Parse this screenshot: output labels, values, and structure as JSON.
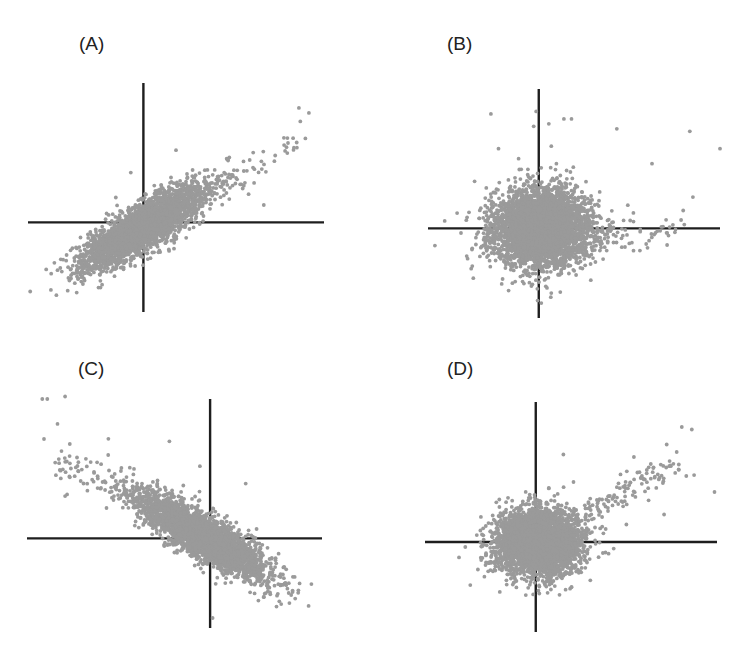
{
  "chart_data": [
    {
      "id": "A",
      "type": "scatter",
      "title": "(A)",
      "xlabel": "",
      "ylabel": "",
      "xlim": [
        -2.3,
        3.6
      ],
      "ylim": [
        -1.8,
        2.8
      ],
      "axes_cross_at": [
        0,
        0
      ],
      "grid": false,
      "legend": "none",
      "description": "Strong positive linear correlation; dense elongated cloud centered slightly below-left of origin with a sparse tail toward upper right",
      "cloud": {
        "n": 3200,
        "cx": 0.0,
        "cy": -0.1,
        "sx": 0.7,
        "sy": 0.2,
        "angle_deg": 32
      },
      "tail": {
        "n": 60,
        "from": [
          1.3,
          0.6
        ],
        "to": [
          3.1,
          1.6
        ],
        "spread": 0.28
      },
      "outliers": [
        [
          3.1,
          2.3
        ],
        [
          3.3,
          2.2
        ],
        [
          0.65,
          1.45
        ],
        [
          -0.25,
          1.0
        ],
        [
          -0.55,
          0.5
        ],
        [
          2.8,
          1.7
        ],
        [
          3.0,
          1.5
        ],
        [
          2.4,
          0.35
        ],
        [
          1.0,
          -0.1
        ],
        [
          -1.6,
          -0.75
        ],
        [
          -1.5,
          -0.9
        ],
        [
          -1.3,
          -1.0
        ],
        [
          0.3,
          -0.6
        ]
      ]
    },
    {
      "id": "B",
      "type": "scatter",
      "title": "(B)",
      "xlabel": "",
      "ylabel": "",
      "xlim": [
        -2.2,
        3.6
      ],
      "ylim": [
        -1.8,
        2.8
      ],
      "axes_cross_at": [
        0,
        0
      ],
      "grid": false,
      "legend": "none",
      "description": "No correlation; roughly circular dense cloud centered at origin with scattered points extending upward and to the right",
      "cloud": {
        "n": 4200,
        "cx": 0.05,
        "cy": 0.0,
        "sx": 0.48,
        "sy": 0.38,
        "angle_deg": 0
      },
      "tail": {
        "n": 70,
        "from": [
          0.9,
          -0.2
        ],
        "to": [
          2.9,
          0.1
        ],
        "spread": 0.35
      },
      "outliers": [
        [
          -0.95,
          2.3
        ],
        [
          -0.1,
          2.05
        ],
        [
          0.2,
          2.1
        ],
        [
          0.5,
          2.2
        ],
        [
          0.65,
          2.2
        ],
        [
          1.55,
          2.0
        ],
        [
          3.0,
          1.95
        ],
        [
          3.6,
          1.6
        ],
        [
          2.25,
          1.3
        ],
        [
          -1.3,
          -1.0
        ],
        [
          -1.1,
          -0.5
        ],
        [
          -0.6,
          -1.25
        ],
        [
          0.25,
          -1.3
        ],
        [
          0.05,
          -1.5
        ],
        [
          -0.05,
          2.35
        ],
        [
          0.25,
          1.65
        ],
        [
          0.35,
          1.3
        ],
        [
          -0.4,
          1.4
        ],
        [
          -0.8,
          1.6
        ]
      ]
    },
    {
      "id": "C",
      "type": "scatter",
      "title": "(C)",
      "xlabel": "",
      "ylabel": "",
      "xlim": [
        -3.6,
        2.2
      ],
      "ylim": [
        -1.8,
        2.8
      ],
      "axes_cross_at": [
        0,
        0
      ],
      "grid": false,
      "legend": "none",
      "description": "Strong negative linear correlation; dense elongated cloud centered slightly below-right of origin with sparse tail toward upper left",
      "cloud": {
        "n": 3200,
        "cx": -0.15,
        "cy": 0.05,
        "sx": 0.75,
        "sy": 0.2,
        "angle_deg": -33
      },
      "tail": {
        "n": 70,
        "from": [
          -1.6,
          0.8
        ],
        "to": [
          -3.0,
          1.6
        ],
        "spread": 0.3
      },
      "outliers": [
        [
          -3.3,
          2.8
        ],
        [
          -3.2,
          2.8
        ],
        [
          -2.85,
          2.85
        ],
        [
          -3.0,
          2.3
        ],
        [
          -2.0,
          2.0
        ],
        [
          -0.8,
          1.95
        ],
        [
          -0.2,
          1.45
        ],
        [
          0.7,
          1.1
        ],
        [
          -2.85,
          0.85
        ],
        [
          0.9,
          -0.75
        ],
        [
          0.95,
          -1.25
        ],
        [
          0.05,
          -1.6
        ],
        [
          1.3,
          -0.5
        ],
        [
          1.45,
          -0.8
        ]
      ]
    },
    {
      "id": "D",
      "type": "scatter",
      "title": "(D)",
      "xlabel": "",
      "ylabel": "",
      "xlim": [
        -2.2,
        3.6
      ],
      "ylim": [
        -1.8,
        2.8
      ],
      "axes_cross_at": [
        0,
        0
      ],
      "grid": false,
      "legend": "none",
      "description": "Dense roughly circular cloud centered at origin with a distinct arm of points extending to the upper right",
      "cloud": {
        "n": 3800,
        "cx": 0.05,
        "cy": 0.0,
        "sx": 0.42,
        "sy": 0.32,
        "angle_deg": 0
      },
      "tail": {
        "n": 110,
        "from": [
          0.95,
          0.6
        ],
        "to": [
          2.9,
          1.6
        ],
        "spread": 0.25
      },
      "outliers": [
        [
          2.9,
          2.3
        ],
        [
          3.1,
          2.25
        ],
        [
          2.6,
          1.95
        ],
        [
          2.8,
          1.8
        ],
        [
          0.55,
          1.75
        ],
        [
          1.95,
          1.7
        ],
        [
          3.55,
          1.0
        ],
        [
          0.75,
          1.2
        ],
        [
          2.55,
          0.55
        ],
        [
          1.8,
          0.35
        ],
        [
          -1.4,
          -0.1
        ],
        [
          -1.15,
          -0.55
        ],
        [
          0.3,
          -0.95
        ],
        [
          -0.1,
          -0.8
        ]
      ]
    }
  ]
}
